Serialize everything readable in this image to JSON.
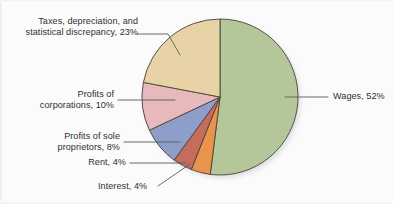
{
  "figure": {
    "background_color": "#fbfbfc",
    "text_color": "#2f2f33"
  },
  "chart_data": {
    "type": "pie",
    "title": "",
    "subtitle": "",
    "xlabel": "",
    "ylabel": "",
    "legend_position": "none",
    "grid": false,
    "start_angle_deg": 0,
    "direction": "clockwise",
    "units": "percent",
    "total": 101,
    "categories": [
      "Wages",
      "Interest",
      "Rent",
      "Profits of sole proprietors",
      "Profits of corporations",
      "Taxes, depreciation, and statistical discrepancy"
    ],
    "values": [
      52,
      4,
      4,
      8,
      10,
      23
    ],
    "colors": [
      "#b4c79b",
      "#e9944d",
      "#c56c5c",
      "#8f9dc9",
      "#e7b9bd",
      "#e7d3a6"
    ],
    "slices": [
      {
        "name": "Wages",
        "value": 52,
        "label": "Wages, 52%",
        "color": "#b4c79b",
        "start_deg": 0,
        "end_deg": 187.2
      },
      {
        "name": "Interest",
        "value": 4,
        "label": "Interest, 4%",
        "color": "#e9944d",
        "start_deg": 187.2,
        "end_deg": 201.6
      },
      {
        "name": "Rent",
        "value": 4,
        "label": "Rent, 4%",
        "color": "#c56c5c",
        "start_deg": 201.6,
        "end_deg": 216.0
      },
      {
        "name": "Profits of sole proprietors",
        "value": 8,
        "label_line1": "Profits of sole",
        "label_line2": "proprietors, 8%",
        "color": "#8f9dc9",
        "start_deg": 216.0,
        "end_deg": 244.8
      },
      {
        "name": "Profits of corporations",
        "value": 10,
        "label_line1": "Profits of",
        "label_line2": "corporations, 10%",
        "color": "#e7b9bd",
        "start_deg": 244.8,
        "end_deg": 280.8
      },
      {
        "name": "Taxes, depreciation, and statistical discrepancy",
        "value": 23,
        "label_line1": "Taxes, depreciation, and",
        "label_line2": "statistical discrepancy, 23%",
        "color": "#e7d3a6",
        "start_deg": 280.8,
        "end_deg": 360.0
      }
    ]
  },
  "labels": {
    "taxes_l1": "Taxes, depreciation, and",
    "taxes_l2": "statistical discrepancy, 23%",
    "corporations_l1": "Profits of",
    "corporations_l2": "corporations, 10%",
    "sole_l1": "Profits of sole",
    "sole_l2": "proprietors, 8%",
    "rent": "Rent, 4%",
    "interest": "Interest, 4%",
    "wages": "Wages, 52%"
  }
}
